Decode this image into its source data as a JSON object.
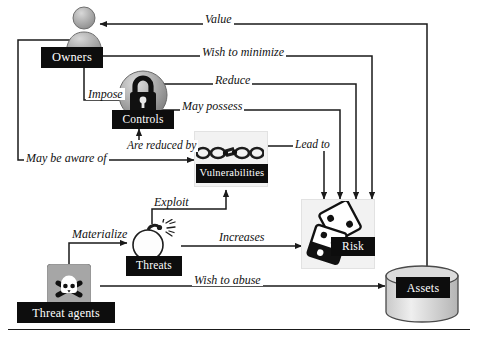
{
  "diagram": {
    "nodes": [
      {
        "id": "owners",
        "label": "Owners",
        "icon": "person-icon"
      },
      {
        "id": "controls",
        "label": "Controls",
        "icon": "padlock-icon"
      },
      {
        "id": "vulnerabilities",
        "label": "Vulnerabilities",
        "icon": "broken-chain-icon"
      },
      {
        "id": "threats",
        "label": "Threats",
        "icon": "bomb-icon"
      },
      {
        "id": "threat_agents",
        "label": "Threat agents",
        "icon": "skull-crossbones-icon"
      },
      {
        "id": "risk",
        "label": "Risk",
        "icon": "dice-icon"
      },
      {
        "id": "assets",
        "label": "Assets",
        "icon": "database-cylinder-icon"
      }
    ],
    "edges": [
      {
        "id": "value",
        "label": "Value",
        "from": "assets",
        "to": "owners"
      },
      {
        "id": "wish_to_minimize",
        "label": "Wish to minimize",
        "from": "owners",
        "to": "risk"
      },
      {
        "id": "reduce",
        "label": "Reduce",
        "from": "controls",
        "to": "risk"
      },
      {
        "id": "may_possess",
        "label": "May possess",
        "from": "controls",
        "to": "risk"
      },
      {
        "id": "impose",
        "label": "Impose",
        "from": "owners",
        "to": "controls"
      },
      {
        "id": "are_reduced_by",
        "label": "Are reduced by",
        "from": "vulnerabilities",
        "to": "controls"
      },
      {
        "id": "may_be_aware_of",
        "label": "May be aware of",
        "from": "owners",
        "to": "vulnerabilities"
      },
      {
        "id": "lead_to",
        "label": "Lead to",
        "from": "vulnerabilities",
        "to": "risk"
      },
      {
        "id": "exploit",
        "label": "Exploit",
        "from": "threats",
        "to": "vulnerabilities"
      },
      {
        "id": "materialize",
        "label": "Materialize",
        "from": "threat_agents",
        "to": "threats"
      },
      {
        "id": "increases",
        "label": "Increases",
        "from": "threats",
        "to": "risk"
      },
      {
        "id": "wish_to_abuse",
        "label": "Wish to abuse",
        "from": "threat_agents",
        "to": "assets"
      }
    ],
    "colors": {
      "caption_bg": "#0d0d0d",
      "caption_text": "#ffffff",
      "line": "#1a1a1a",
      "icon_gray": "#9a9a9a",
      "panel": "#f2f2f2"
    }
  }
}
